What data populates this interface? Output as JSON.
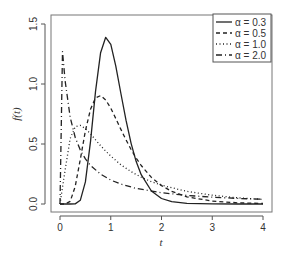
{
  "chart_data": {
    "type": "line",
    "title": "",
    "xlabel": "t",
    "ylabel": "f(t)",
    "xlim": [
      0,
      4
    ],
    "ylim": [
      0,
      1.5
    ],
    "xticks": [
      "0",
      "1",
      "2",
      "3",
      "4"
    ],
    "yticks": [
      "0.0",
      "0.5",
      "1.0",
      "1.5"
    ],
    "grid": false,
    "legend_position": "top-right",
    "series": [
      {
        "name": "α = 0.3",
        "line_style": "solid",
        "x": [
          0,
          0.2,
          0.3,
          0.4,
          0.5,
          0.6,
          0.7,
          0.8,
          0.9,
          1.0,
          1.1,
          1.2,
          1.3,
          1.4,
          1.5,
          1.6,
          1.8,
          2.0,
          2.2,
          2.5,
          3.0,
          3.5,
          4.0
        ],
        "y": [
          0,
          0.0,
          0.001,
          0.031,
          0.184,
          0.52,
          0.937,
          1.261,
          1.389,
          1.33,
          1.149,
          0.921,
          0.698,
          0.506,
          0.356,
          0.244,
          0.108,
          0.046,
          0.019,
          0.005,
          0.0005,
          0.0,
          0.0
        ]
      },
      {
        "name": "α = 0.5",
        "line_style": "dashed",
        "x": [
          0,
          0.1,
          0.2,
          0.3,
          0.4,
          0.5,
          0.6,
          0.7,
          0.8,
          0.9,
          1.0,
          1.1,
          1.2,
          1.3,
          1.4,
          1.5,
          1.6,
          1.8,
          2.0,
          2.2,
          2.5,
          3.0,
          3.5,
          4.0
        ],
        "y": [
          0,
          0.0002,
          0.022,
          0.146,
          0.372,
          0.61,
          0.789,
          0.884,
          0.903,
          0.867,
          0.798,
          0.712,
          0.622,
          0.535,
          0.454,
          0.383,
          0.321,
          0.222,
          0.153,
          0.105,
          0.06,
          0.024,
          0.01,
          0.004
        ]
      },
      {
        "name": "α = 1.0",
        "line_style": "dotted",
        "x": [
          0,
          0.1,
          0.2,
          0.3,
          0.4,
          0.5,
          0.6,
          0.7,
          0.8,
          0.9,
          1.0,
          1.2,
          1.4,
          1.6,
          1.8,
          2.0,
          2.5,
          3.0,
          3.5,
          4.0
        ],
        "y": [
          0,
          0.282,
          0.546,
          0.644,
          0.655,
          0.628,
          0.584,
          0.535,
          0.486,
          0.441,
          0.399,
          0.327,
          0.269,
          0.223,
          0.186,
          0.157,
          0.105,
          0.073,
          0.052,
          0.038
        ]
      },
      {
        "name": "α = 2.0",
        "line_style": "dash-dot",
        "x": [
          0,
          0.05,
          0.1,
          0.2,
          0.3,
          0.4,
          0.5,
          0.6,
          0.8,
          1.0,
          1.2,
          1.5,
          2.0,
          2.5,
          3.0,
          3.5,
          4.0
        ],
        "y": [
          0,
          1.27,
          1.028,
          0.722,
          0.555,
          0.449,
          0.376,
          0.322,
          0.248,
          0.199,
          0.166,
          0.13,
          0.094,
          0.072,
          0.057,
          0.047,
          0.039
        ]
      }
    ]
  }
}
